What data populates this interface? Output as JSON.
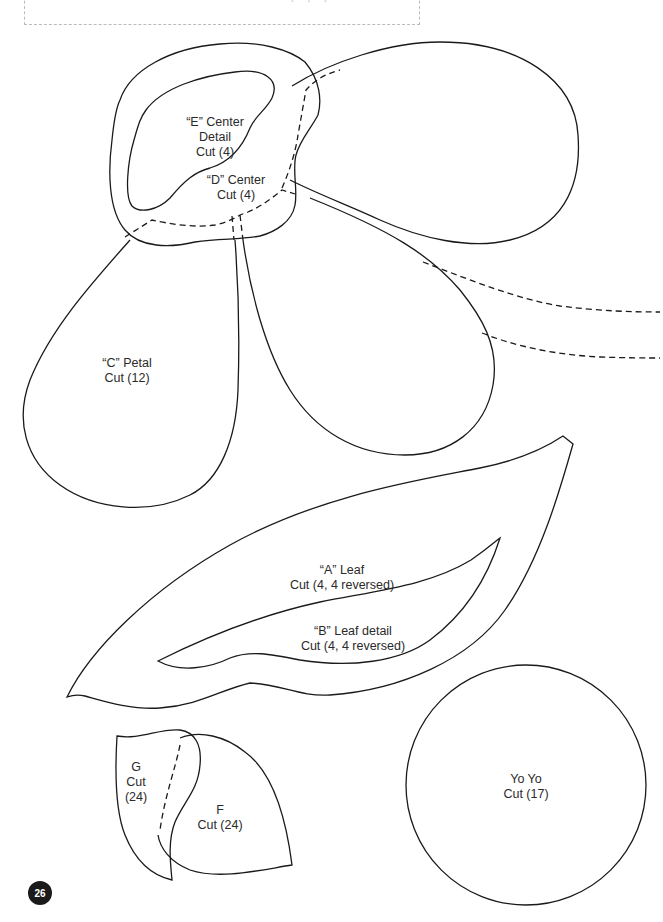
{
  "page": {
    "number": "26",
    "title_fragment": "· · ·"
  },
  "pieces": {
    "e_center": {
      "line1": "“E” Center",
      "line2": "Detail",
      "line3": "Cut (4)"
    },
    "d_center": {
      "line1": "“D” Center",
      "line2": "Cut (4)"
    },
    "c_petal": {
      "line1": "“C” Petal",
      "line2": "Cut (12)"
    },
    "a_leaf": {
      "line1": "“A” Leaf",
      "line2": "Cut (4, 4 reversed)"
    },
    "b_leaf_detail": {
      "line1": "“B” Leaf detail",
      "line2": "Cut (4, 4 reversed)"
    },
    "g": {
      "line1": "G",
      "line2": "Cut",
      "line3": "(24)"
    },
    "f": {
      "line1": "F",
      "line2": "Cut (24)"
    },
    "yoyo": {
      "line1": "Yo Yo",
      "line2": "Cut (17)"
    }
  },
  "colors": {
    "line": "#1a1a1a",
    "dashed_box": "#bbbbbb",
    "badge": "#1a1a1a"
  }
}
